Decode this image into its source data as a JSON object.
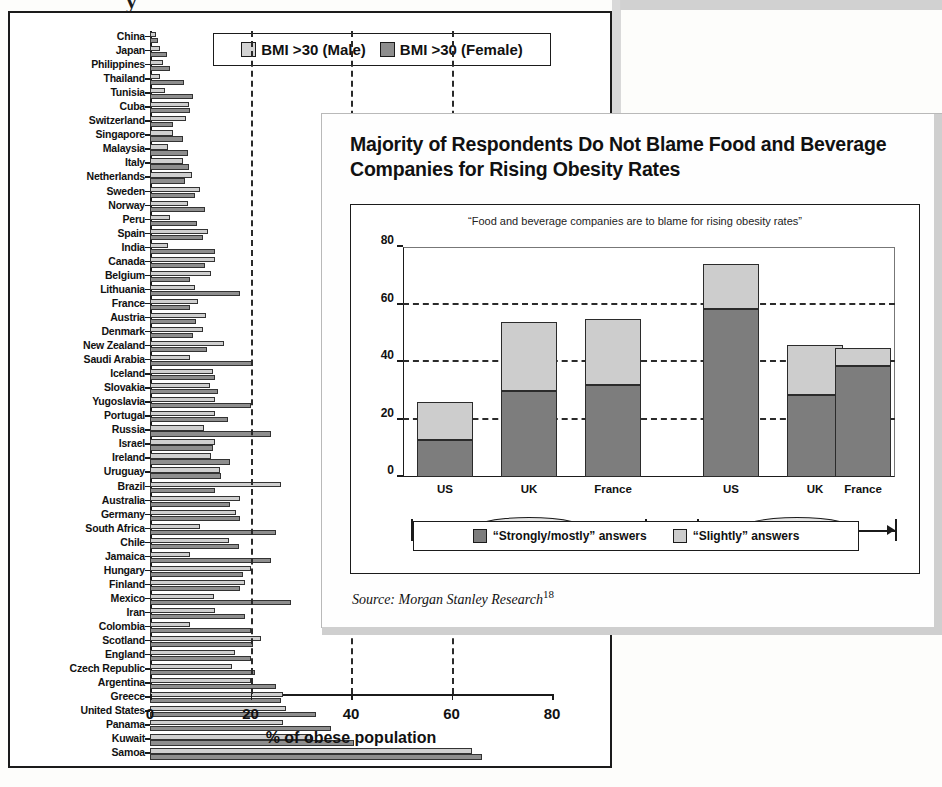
{
  "left_chart": {
    "axis_title": "% of obese population",
    "legend": [
      {
        "label": "BMI >30 (Male)",
        "color": "#d3d3d3",
        "icon": "legend-swatch-male"
      },
      {
        "label": "BMI >30 (Female)",
        "color": "#8e8e8e",
        "icon": "legend-swatch-female"
      }
    ],
    "xticks": [
      "0",
      "20",
      "40",
      "60",
      "80"
    ],
    "cut_glyph": "y"
  },
  "right_chart": {
    "title": "Majority of Respondents Do Not Blame Food and Beverage Companies for Rising Obesity Rates",
    "subtitle": "“Food and beverage companies are to blame for rising obesity rates”",
    "yticks": [
      "80",
      "60",
      "40",
      "20",
      "0"
    ],
    "groups": [
      {
        "name": "Agree",
        "categories": [
          "US",
          "UK",
          "France"
        ]
      },
      {
        "name": "Disagree",
        "categories": [
          "US",
          "UK",
          "France"
        ]
      }
    ],
    "legend": [
      {
        "label": "“Strongly/mostly” answers",
        "color": "#7d7d7d",
        "icon": "legend-swatch-strongly"
      },
      {
        "label": "“Slightly” answers",
        "color": "#cdcdcd",
        "icon": "legend-swatch-slightly"
      }
    ],
    "source": "Source: Morgan Stanley Research",
    "source_footnote": "18"
  },
  "chart_data": [
    {
      "type": "bar",
      "orientation": "horizontal",
      "title": "",
      "xlabel": "% of obese population",
      "ylabel": "",
      "xlim": [
        0,
        80
      ],
      "xticks": [
        0,
        20,
        40,
        60,
        80
      ],
      "grid": "vertical-dashed",
      "legend_position": "top-center",
      "categories": [
        "China",
        "Japan",
        "Philippines",
        "Thailand",
        "Tunisia",
        "Cuba",
        "Switzerland",
        "Singapore",
        "Malaysia",
        "Italy",
        "Netherlands",
        "Sweden",
        "Norway",
        "Peru",
        "Spain",
        "India",
        "Canada",
        "Belgium",
        "Lithuania",
        "France",
        "Austria",
        "Denmark",
        "New Zealand",
        "Saudi Arabia",
        "Iceland",
        "Slovakia",
        "Yugoslavia",
        "Portugal",
        "Russia",
        "Israel",
        "Ireland",
        "Uruguay",
        "Brazil",
        "Australia",
        "Germany",
        "South Africa",
        "Chile",
        "Jamaica",
        "Hungary",
        "Finland",
        "Mexico",
        "Iran",
        "Colombia",
        "Scotland",
        "England",
        "Czech Republic",
        "Argentina",
        "Greece",
        "United States",
        "Panama",
        "Kuwait",
        "Samoa"
      ],
      "series": [
        {
          "name": "BMI >30 (Male)",
          "color": "#d3d3d3",
          "values": [
            1.2,
            2.0,
            2.5,
            2.0,
            3.0,
            7.8,
            7.2,
            4.5,
            3.5,
            6.5,
            8.4,
            10.0,
            7.5,
            4.0,
            11.5,
            3.5,
            13.0,
            12.1,
            9.0,
            9.6,
            11.1,
            10.5,
            14.7,
            8.0,
            12.5,
            12.0,
            13.0,
            12.9,
            10.8,
            12.9,
            12.1,
            14.0,
            26.0,
            18.0,
            17.2,
            10.0,
            15.7,
            8.0,
            20.0,
            19.0,
            12.8,
            13.0,
            8.0,
            22.0,
            17.0,
            16.3,
            20.0,
            26.5,
            27.0,
            26.5,
            32.0,
            64.0
          ]
        },
        {
          "name": "BMI >30 (Female)",
          "color": "#8e8e8e",
          "values": [
            1.6,
            3.4,
            4.0,
            6.7,
            8.5,
            8.0,
            4.6,
            6.5,
            7.5,
            7.8,
            7.0,
            9.0,
            11.0,
            9.4,
            10.5,
            13.0,
            11.0,
            8.0,
            18.0,
            8.0,
            9.1,
            8.5,
            11.3,
            20.5,
            13.0,
            13.5,
            20.0,
            15.5,
            24.0,
            12.5,
            16.0,
            14.2,
            13.0,
            16.0,
            18.0,
            25.0,
            17.8,
            24.0,
            18.5,
            18.0,
            28.0,
            19.0,
            20.0,
            20.5,
            20.0,
            20.8,
            25.0,
            26.0,
            33.0,
            36.0,
            40.5,
            66.0
          ]
        }
      ]
    },
    {
      "type": "bar",
      "subtype": "stacked",
      "title": "Majority of Respondents Do Not Blame Food and Beverage Companies for Rising Obesity Rates",
      "subtitle": "“Food and beverage companies are to blame for rising obesity rates”",
      "xlabel": "",
      "ylabel": "",
      "ylim": [
        0,
        80
      ],
      "yticks": [
        0,
        20,
        40,
        60,
        80
      ],
      "grid": "horizontal-dashed",
      "legend_position": "bottom-center",
      "categories": [
        "US",
        "UK",
        "France",
        "US",
        "UK",
        "France"
      ],
      "groups": [
        "Agree",
        "Agree",
        "Agree",
        "Disagree",
        "Disagree",
        "Disagree"
      ],
      "series": [
        {
          "name": "“Strongly/mostly” answers",
          "color": "#7d7d7d",
          "values": [
            13,
            30,
            32,
            58.5,
            28.5,
            38.5
          ]
        },
        {
          "name": "“Slightly” answers",
          "color": "#cdcdcd",
          "values": [
            13,
            24,
            23,
            15.5,
            17.5,
            6.5
          ]
        }
      ],
      "totals": [
        26,
        54,
        55,
        74,
        46,
        45
      ]
    }
  ]
}
